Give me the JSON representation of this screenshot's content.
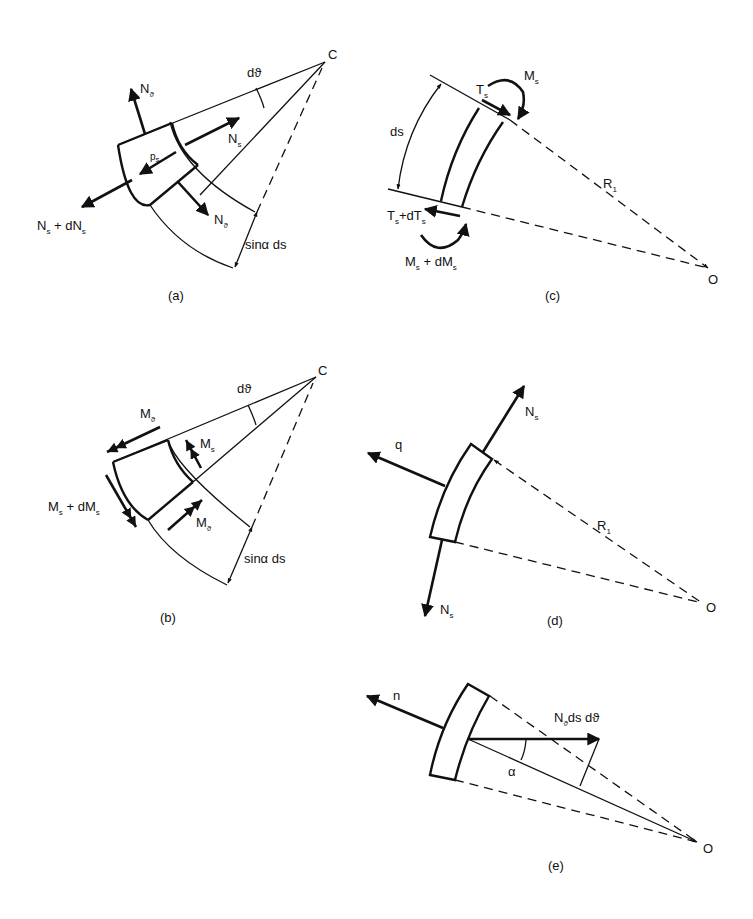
{
  "figure": {
    "background": "#ffffff",
    "ink": "#111111",
    "panels": {
      "a": {
        "caption": "(a)",
        "center_label": "C",
        "angle_label": "dϑ",
        "arc_label": "sinα ds",
        "forces": {
          "n_theta_top": {
            "main": "N",
            "sub": "ϑ"
          },
          "n_s_right": {
            "main": "N",
            "sub": "s"
          },
          "p_s": {
            "main": "p",
            "sub": "s"
          },
          "n_s_left": {
            "main": "N",
            "sub": "s",
            "suffix": " + dN",
            "suffix_sub": "s"
          },
          "n_theta_bottom": {
            "main": "N",
            "sub": "ϑ"
          }
        }
      },
      "b": {
        "caption": "(b)",
        "center_label": "C",
        "angle_label": "dϑ",
        "arc_label": "sinα ds",
        "moments": {
          "m_theta_top": {
            "main": "M",
            "sub": "ϑ"
          },
          "m_s_right": {
            "main": "M",
            "sub": "s"
          },
          "m_s_left": {
            "main": "M",
            "sub": "s",
            "suffix": " + dM",
            "suffix_sub": "s"
          },
          "m_theta_bottom": {
            "main": "M",
            "sub": "ϑ"
          }
        }
      },
      "c": {
        "caption": "(c)",
        "center_label": "O",
        "radius_label": {
          "main": "R",
          "sub": "1"
        },
        "length_label": "ds",
        "forces": {
          "t_s_top": {
            "main": "T",
            "sub": "s"
          },
          "m_s_top": {
            "main": "M",
            "sub": "s"
          },
          "t_s_bottom": {
            "main": "T",
            "sub": "s",
            "suffix": "+dT",
            "suffix_sub": "s"
          },
          "m_s_bottom": {
            "main": "M",
            "sub": "s",
            "suffix": " + dM",
            "suffix_sub": "s"
          }
        }
      },
      "d": {
        "caption": "(d)",
        "center_label": "O",
        "radius_label": {
          "main": "R",
          "sub": "1"
        },
        "load_label": "q",
        "forces": {
          "n_s_top": {
            "main": "N",
            "sub": "s"
          },
          "n_s_bottom": {
            "main": "N",
            "sub": "s"
          }
        }
      },
      "e": {
        "caption": "(e)",
        "center_label": "O",
        "normal_label": "n",
        "angle_label": "α",
        "force_label": {
          "main": "N",
          "sub": "ϑ",
          "suffix": "ds dϑ"
        }
      }
    }
  }
}
